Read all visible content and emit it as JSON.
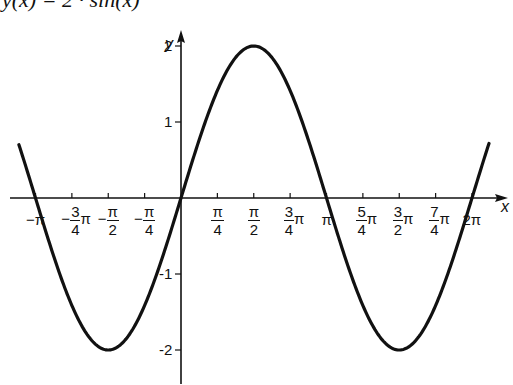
{
  "title": "y(x) = 2 · sin(x)",
  "chart_data": {
    "type": "line",
    "title": "y(x) = 2 · sin(x)",
    "function": "2*sin(x)",
    "xlabel": "x",
    "ylabel": "y",
    "xlim": [
      -3.3,
      6.7
    ],
    "ylim": [
      -2.4,
      2.4
    ],
    "x_ticks": [
      {
        "value": -3.1416,
        "label": "-π"
      },
      {
        "value": -2.3562,
        "label": "-3/4π"
      },
      {
        "value": -1.5708,
        "label": "-π/2"
      },
      {
        "value": -0.7854,
        "label": "-π/4"
      },
      {
        "value": 0.7854,
        "label": "π/4"
      },
      {
        "value": 1.5708,
        "label": "π/2"
      },
      {
        "value": 2.3562,
        "label": "3/4π"
      },
      {
        "value": 3.1416,
        "label": "π"
      },
      {
        "value": 3.927,
        "label": "5/4π"
      },
      {
        "value": 4.7124,
        "label": "3/2π"
      },
      {
        "value": 5.4978,
        "label": "7/4π"
      },
      {
        "value": 6.2832,
        "label": "2π"
      }
    ],
    "y_ticks": [
      {
        "value": 2,
        "label": "2"
      },
      {
        "value": 1,
        "label": "1"
      },
      {
        "value": -1,
        "label": "-1"
      },
      {
        "value": -2,
        "label": "-2"
      }
    ],
    "series": [
      {
        "name": "2 sin(x)",
        "x": [
          -3.5,
          -3.1416,
          -2.3562,
          -1.5708,
          -0.7854,
          0,
          0.7854,
          1.5708,
          2.3562,
          3.1416,
          3.927,
          4.7124,
          5.4978,
          6.2832,
          6.65
        ],
        "y": [
          0.7,
          0,
          -1.414,
          -2,
          -1.414,
          0,
          1.414,
          2,
          1.414,
          0,
          -1.414,
          -2,
          -1.414,
          0,
          0.72
        ]
      }
    ],
    "grid": false,
    "legend": null
  },
  "axes": {
    "x_name": "x",
    "y_name": "y"
  },
  "ticks_x": [
    {
      "type": "plain",
      "text": "-π"
    },
    {
      "type": "frac",
      "pre": "−",
      "num": "3",
      "den": "4",
      "post": "π"
    },
    {
      "type": "frac",
      "pre": "−",
      "num": "π",
      "den": "2",
      "post": ""
    },
    {
      "type": "frac",
      "pre": "−",
      "num": "π",
      "den": "4",
      "post": ""
    },
    {
      "type": "frac",
      "pre": "",
      "num": "π",
      "den": "4",
      "post": ""
    },
    {
      "type": "frac",
      "pre": "",
      "num": "π",
      "den": "2",
      "post": ""
    },
    {
      "type": "frac",
      "pre": "",
      "num": "3",
      "den": "4",
      "post": "π"
    },
    {
      "type": "plain",
      "text": "π"
    },
    {
      "type": "frac",
      "pre": "",
      "num": "5",
      "den": "4",
      "post": "π"
    },
    {
      "type": "frac",
      "pre": "",
      "num": "3",
      "den": "2",
      "post": "π"
    },
    {
      "type": "frac",
      "pre": "",
      "num": "7",
      "den": "4",
      "post": "π"
    },
    {
      "type": "plain",
      "text": "2π"
    }
  ]
}
